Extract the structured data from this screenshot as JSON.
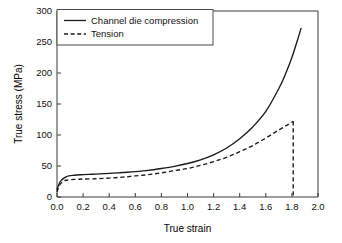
{
  "chart_data": {
    "type": "line",
    "title": "",
    "xlabel": "True strain",
    "ylabel": "True stress (MPa)",
    "xlim": [
      0.0,
      2.0
    ],
    "ylim": [
      0,
      300
    ],
    "grid": false,
    "legend_position": "upper-left-inside",
    "xticks": [
      "0.0",
      "0.2",
      "0.4",
      "0.6",
      "0.8",
      "1.0",
      "1.2",
      "1.4",
      "1.6",
      "1.8",
      "2.0"
    ],
    "xtick_values": [
      0.0,
      0.2,
      0.4,
      0.6,
      0.8,
      1.0,
      1.2,
      1.4,
      1.6,
      1.8,
      2.0
    ],
    "yticks": [
      "0",
      "50",
      "100",
      "150",
      "200",
      "250",
      "300"
    ],
    "ytick_values": [
      0,
      50,
      100,
      150,
      200,
      250,
      300
    ],
    "series": [
      {
        "name": "Channel die compression",
        "style": "solid",
        "color": "#1a1a1a",
        "x": [
          0.0,
          0.01,
          0.02,
          0.03,
          0.05,
          0.07,
          0.09,
          0.12,
          0.15,
          0.2,
          0.25,
          0.3,
          0.4,
          0.5,
          0.6,
          0.7,
          0.8,
          0.9,
          1.0,
          1.1,
          1.2,
          1.3,
          1.4,
          1.5,
          1.6,
          1.7,
          1.75,
          1.8,
          1.85,
          1.87
        ],
        "y": [
          12,
          18,
          23,
          26,
          30,
          32.5,
          34,
          35,
          35.5,
          36,
          36.5,
          37,
          38,
          39.5,
          41,
          43,
          46,
          49.5,
          54,
          60,
          68,
          79,
          94,
          113,
          138,
          175,
          198,
          225,
          258,
          272
        ]
      },
      {
        "name": "Tension",
        "style": "dashed",
        "color": "#1a1a1a",
        "x": [
          0.0,
          0.01,
          0.02,
          0.03,
          0.05,
          0.07,
          0.1,
          0.15,
          0.2,
          0.3,
          0.4,
          0.5,
          0.6,
          0.7,
          0.8,
          0.9,
          1.0,
          1.1,
          1.2,
          1.3,
          1.4,
          1.5,
          1.6,
          1.7,
          1.78,
          1.81
        ],
        "y": [
          8,
          14,
          19,
          22,
          25.5,
          27,
          28,
          28.5,
          29,
          29.5,
          30.5,
          32,
          34,
          36,
          39,
          42.5,
          46,
          51,
          57,
          64,
          73,
          83,
          95,
          108,
          118,
          122
        ]
      }
    ],
    "annotations": [
      {
        "name": "tension-fracture-drop",
        "style": "dashed",
        "x": 1.81,
        "y_from": 122,
        "y_to": 0
      }
    ]
  },
  "legend": {
    "entries": [
      {
        "label": "Channel die compression",
        "style": "solid"
      },
      {
        "label": "Tension",
        "style": "dashed"
      }
    ]
  }
}
